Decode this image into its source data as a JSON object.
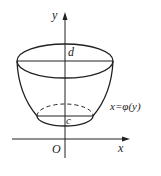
{
  "figure": {
    "axes": {
      "x_label": "x",
      "y_label": "y",
      "origin_label": "O"
    },
    "levels": {
      "top": "d",
      "bottom": "c"
    },
    "curve_label": "x=φ(y)",
    "colors": {
      "stroke": "#222222",
      "background": "#ffffff"
    }
  }
}
